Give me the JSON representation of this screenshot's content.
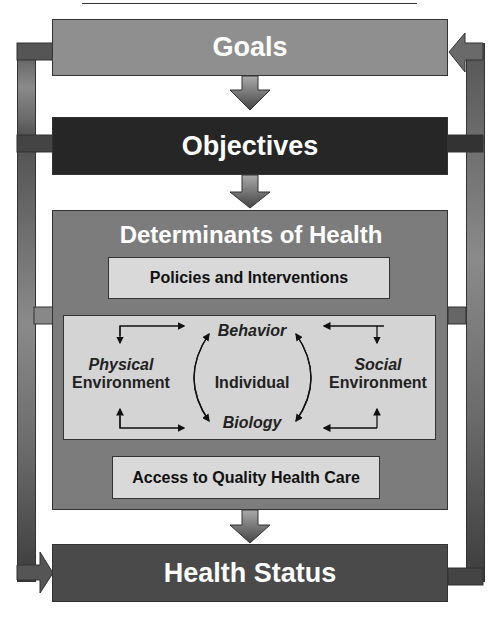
{
  "diagram": {
    "goals": "Goals",
    "objectives": "Objectives",
    "determinants": {
      "title": "Determinants of Health",
      "policies": "Policies and Interventions",
      "access": "Access to Quality Health Care",
      "inner": {
        "behavior": "Behavior",
        "biology": "Biology",
        "individual": "Individual",
        "physical_1": "Physical",
        "physical_2": "Environment",
        "social_1": "Social",
        "social_2": "Environment"
      }
    },
    "health_status": "Health Status"
  },
  "colors": {
    "goals": "#8f8f8f",
    "objectives": "#262626",
    "determinants": "#7c7c7c",
    "health_status": "#4a4a4a",
    "light_box": "#d9d9d9"
  }
}
